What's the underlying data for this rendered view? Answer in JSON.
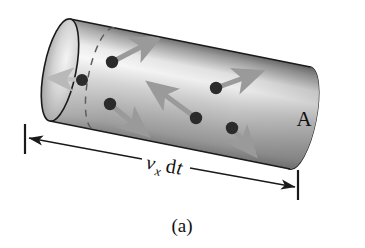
{
  "figure": {
    "caption": "(a)",
    "area_label": "A",
    "length_label": {
      "symbol": "v",
      "subscript": "x",
      "differential": "d",
      "variable": "t",
      "full_text": "v_x dt"
    },
    "colors": {
      "background": "#ffffff",
      "cylinder_light": "#f2f2f2",
      "cylinder_mid": "#bdbdbd",
      "cylinder_dark": "#8a8a8a",
      "end_cap_fill": "#a8a8a8",
      "outline": "#1a1a1a",
      "dot": "#2b2b2b",
      "arrow": "#9a9a9a",
      "dashed": "#5a5a5a",
      "dimension_line": "#1a1a1a"
    },
    "geometry": {
      "axis_start_x": 60,
      "axis_start_y": 70,
      "axis_end_x": 300,
      "axis_end_y": 118,
      "cap_radius_x": 16,
      "cap_radius_y": 52
    },
    "particles": [
      {
        "name": "particle-1",
        "x": 112,
        "y": 62,
        "arrow_dx": 46,
        "arrow_dy": -24
      },
      {
        "name": "particle-2",
        "x": 82,
        "y": 80,
        "arrow_dx": -32,
        "arrow_dy": -2,
        "faint": true
      },
      {
        "name": "particle-3",
        "x": 110,
        "y": 104,
        "arrow_dx": 36,
        "arrow_dy": 30
      },
      {
        "name": "particle-4",
        "x": 196,
        "y": 118,
        "arrow_dx": -46,
        "arrow_dy": -34
      },
      {
        "name": "particle-5",
        "x": 216,
        "y": 88,
        "arrow_dx": 44,
        "arrow_dy": -16
      },
      {
        "name": "particle-6",
        "x": 232,
        "y": 128,
        "arrow_dx": 22,
        "arrow_dy": 26
      }
    ],
    "dimension": {
      "left_tick_x": 25,
      "left_tick_top": 124,
      "left_tick_bottom": 154,
      "right_tick_x": 298,
      "right_tick_top": 170,
      "right_tick_bottom": 200,
      "line_start_x": 30,
      "line_start_y": 137,
      "line_end_x": 294,
      "line_end_y": 188
    }
  }
}
